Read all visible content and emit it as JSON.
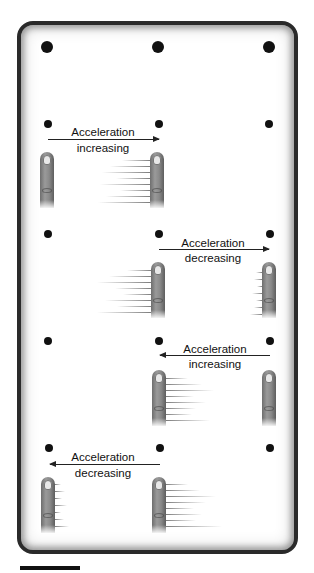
{
  "figure": {
    "type": "touchscreen-swipe-acceleration-diagram",
    "grid": {
      "columns": 3,
      "rows": 5
    },
    "panels": [
      {
        "row": 1,
        "label_line1": "Acceleration",
        "label_line2": "increasing",
        "direction": "right",
        "from_column": 1,
        "to_column": 2,
        "start_finger": "static",
        "end_finger": "long-motion-streaks-left"
      },
      {
        "row": 2,
        "label_line1": "Acceleration",
        "label_line2": "decreasing",
        "direction": "right",
        "from_column": 2,
        "to_column": 3,
        "start_finger": "long-motion-streaks-left",
        "end_finger": "short-motion-streaks-left"
      },
      {
        "row": 3,
        "label_line1": "Acceleration",
        "label_line2": "increasing",
        "direction": "left",
        "from_column": 3,
        "to_column": 2,
        "start_finger": "static",
        "end_finger": "long-motion-streaks-right"
      },
      {
        "row": 4,
        "label_line1": "Acceleration",
        "label_line2": "decreasing",
        "direction": "left",
        "from_column": 2,
        "to_column": 1,
        "start_finger": "long-motion-streaks-right",
        "end_finger": "short-motion-streaks-right"
      }
    ],
    "scale_bar": true,
    "colors": {
      "border": "#2a2a2a",
      "dots": "#111111",
      "finger": "#8a8a8a",
      "nail": "#e8e8e8",
      "background": "#ffffff"
    }
  }
}
